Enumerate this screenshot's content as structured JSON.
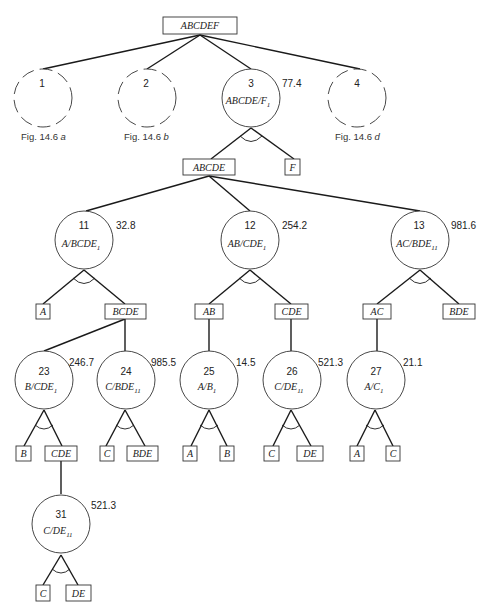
{
  "diagram": {
    "root": {
      "label": "ABCDEF"
    },
    "level1": [
      {
        "id": "1",
        "caption_text": "Fig. 14.6 ",
        "caption_sub": "a",
        "dashed": true
      },
      {
        "id": "2",
        "caption_text": "Fig. 14.6 ",
        "caption_sub": "b",
        "dashed": true
      },
      {
        "id": "3",
        "expr": "ABCDE/F",
        "sub": "1",
        "cost": "77.4",
        "dashed": false
      },
      {
        "id": "4",
        "caption_text": "Fig. 14.6 ",
        "caption_sub": "d",
        "dashed": true
      }
    ],
    "node3_children": [
      {
        "label": "ABCDE"
      },
      {
        "label": "F"
      }
    ],
    "level2": [
      {
        "id": "11",
        "expr": "A/BCDE",
        "sub": "1",
        "cost": "32.8",
        "children": [
          "A",
          "BCDE"
        ]
      },
      {
        "id": "12",
        "expr": "AB/CDE",
        "sub": "1",
        "cost": "254.2",
        "children": [
          "AB",
          "CDE"
        ]
      },
      {
        "id": "13",
        "expr": "AC/BDE",
        "sub": "11",
        "cost": "981.6",
        "children": [
          "AC",
          "BDE"
        ]
      }
    ],
    "level3": [
      {
        "id": "23",
        "expr": "B/CDE",
        "sub": "1",
        "cost": "246.7",
        "children": [
          "B",
          "CDE"
        ]
      },
      {
        "id": "24",
        "expr": "C/BDE",
        "sub": "11",
        "cost": "985.5",
        "children": [
          "C",
          "BDE"
        ]
      },
      {
        "id": "25",
        "expr": "A/B",
        "sub": "1",
        "cost": "14.5",
        "children": [
          "A",
          "B"
        ]
      },
      {
        "id": "26",
        "expr": "C/DE",
        "sub": "11",
        "cost": "521.3",
        "children": [
          "C",
          "DE"
        ]
      },
      {
        "id": "27",
        "expr": "A/C",
        "sub": "1",
        "cost": "21.1",
        "children": [
          "A",
          "C"
        ]
      }
    ],
    "level4": [
      {
        "id": "31",
        "expr": "C/DE",
        "sub": "11",
        "cost": "521.3",
        "children": [
          "C",
          "DE"
        ]
      }
    ]
  }
}
